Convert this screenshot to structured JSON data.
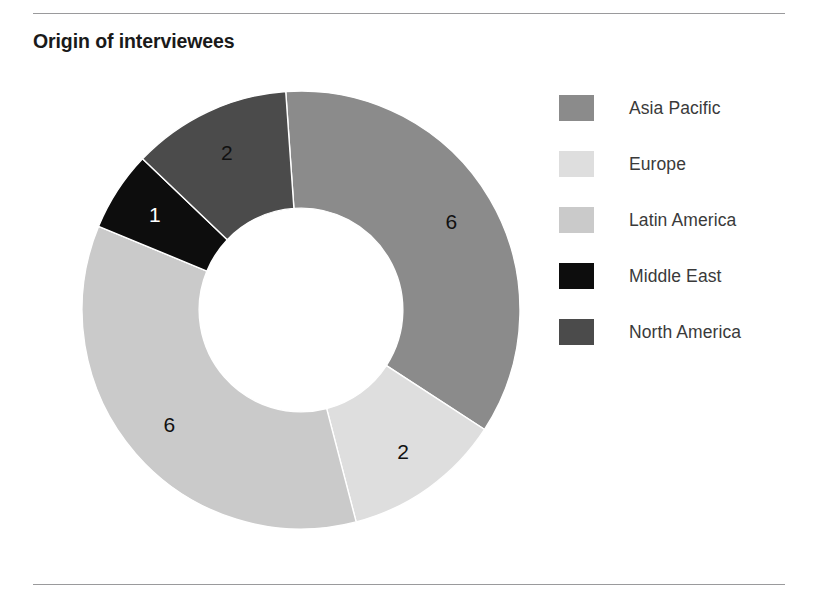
{
  "chart_title": "Origin of interviewees",
  "colors": {
    "asia_pacific": "#8b8b8b",
    "europe": "#dedede",
    "latin_america": "#cacaca",
    "middle_east": "#0d0d0d",
    "north_america": "#4b4b4b",
    "rule": "#9a9a9c",
    "title_text": "#1a1a1a",
    "legend_text": "#3a3a3a",
    "label_dark": "#111111",
    "label_light": "#ffffff",
    "background": "#ffffff"
  },
  "legend": {
    "items": [
      {
        "label": "Asia Pacific",
        "color": "#8b8b8b"
      },
      {
        "label": "Europe",
        "color": "#dedede"
      },
      {
        "label": "Latin America",
        "color": "#cacaca"
      },
      {
        "label": "Middle East",
        "color": "#0d0d0d"
      },
      {
        "label": "North America",
        "color": "#4b4b4b"
      }
    ]
  },
  "chart_data": {
    "type": "pie",
    "variant": "donut",
    "title": "Origin of interviewees",
    "xlabel": "",
    "ylabel": "",
    "total": 17,
    "units": "interviewees",
    "start_angle_deg": -4,
    "direction": "clockwise",
    "inner_radius_ratio": 0.465,
    "legend_position": "right",
    "grid": false,
    "categories": [
      "Asia Pacific",
      "Europe",
      "Latin America",
      "Middle East",
      "North America"
    ],
    "values": [
      6,
      2,
      6,
      1,
      2
    ],
    "slices": [
      {
        "label": "Asia Pacific",
        "value": 6,
        "data_label": "6",
        "color": "#8b8b8b",
        "label_color": "#111111"
      },
      {
        "label": "Europe",
        "value": 2,
        "data_label": "2",
        "color": "#dedede",
        "label_color": "#111111"
      },
      {
        "label": "Latin America",
        "value": 6,
        "data_label": "6",
        "color": "#cacaca",
        "label_color": "#111111"
      },
      {
        "label": "Middle East",
        "value": 1,
        "data_label": "1",
        "color": "#0d0d0d",
        "label_color": "#ffffff"
      },
      {
        "label": "North America",
        "value": 2,
        "data_label": "2",
        "color": "#4b4b4b",
        "label_color": "#111111"
      }
    ]
  }
}
